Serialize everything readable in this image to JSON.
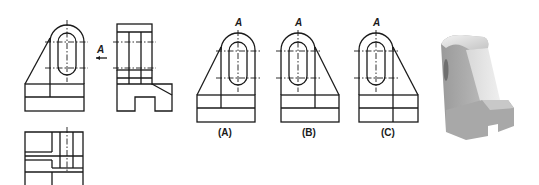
{
  "figure": {
    "given_views": {
      "front_view": {
        "label": ""
      },
      "side_view": {
        "label": "",
        "view_arrow_label": "A"
      },
      "top_view": {
        "label": ""
      }
    },
    "options": [
      {
        "id": "A",
        "label": "(A)",
        "view_letter": "A",
        "slant_side": "left"
      },
      {
        "id": "B",
        "label": "(B)",
        "view_letter": "A",
        "slant_side": "right"
      },
      {
        "id": "C",
        "label": "(C)",
        "view_letter": "A",
        "slant_side": "right"
      }
    ],
    "model_3d": {
      "name": "bracket-3d-model",
      "colors": {
        "light": "#e6e6e6",
        "mid": "#b8b8b8",
        "dark": "#8a8a8a"
      }
    },
    "colors": {
      "line": "#1a1a1a",
      "background": "#ffffff"
    }
  }
}
